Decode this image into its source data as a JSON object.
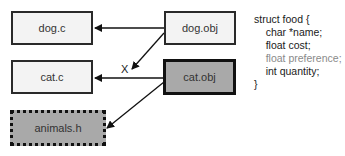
{
  "diagram": {
    "nodes": [
      {
        "id": "dog_c",
        "label": "dog.c",
        "style": "light"
      },
      {
        "id": "cat_c",
        "label": "cat.c",
        "style": "light"
      },
      {
        "id": "dog_obj",
        "label": "dog.obj",
        "style": "light"
      },
      {
        "id": "cat_obj",
        "label": "cat.obj",
        "style": "dark"
      },
      {
        "id": "animals_h",
        "label": "animals.h",
        "style": "dashed"
      }
    ],
    "edges": [
      {
        "from": "dog_obj",
        "to": "dog_c"
      },
      {
        "from": "dog_obj",
        "to": "cat_c",
        "mark": "X"
      },
      {
        "from": "cat_obj",
        "to": "cat_c"
      },
      {
        "from": "cat_obj",
        "to": "animals_h"
      }
    ],
    "x_mark": "X",
    "code": {
      "lines": [
        "struct food {",
        "    char *name;",
        "    float cost;",
        "    float preference;",
        "    int quantity;",
        "}"
      ],
      "muted_line_index": 3
    },
    "colors": {
      "light_fill": "#f3f3f3",
      "dark_fill": "#a9a9a9",
      "border": "#111111",
      "muted_text": "#8a8a8a"
    }
  }
}
